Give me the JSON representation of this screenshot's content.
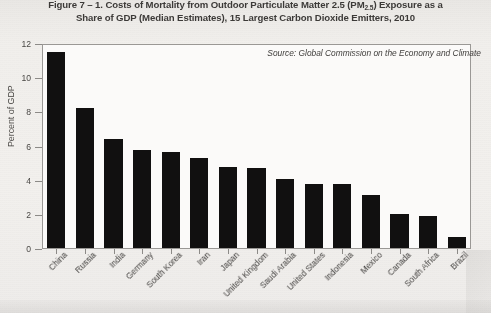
{
  "figure": {
    "title_line_1_pre": "Figure 7 – 1. Costs of Mortality from Outdoor Particulate Matter 2.5 (PM",
    "title_line_1_sub": "2.5",
    "title_line_1_post": ") Exposure as a",
    "title_line_2": "Share of GDP (Median Estimates), 15 Largest Carbon Dioxide Emitters, 2010",
    "source_note": "Source: Global Commission on the Economy and Climate"
  },
  "chart_data": {
    "type": "bar",
    "title": "Figure 7 – 1. Costs of Mortality from Outdoor Particulate Matter 2.5 (PM2.5) Exposure as a Share of GDP (Median Estimates), 15 Largest Carbon Dioxide Emitters, 2010",
    "xlabel": "",
    "ylabel": "Percent of GDP",
    "ylim": [
      0,
      12
    ],
    "yticks": [
      0,
      2,
      4,
      6,
      8,
      10,
      12
    ],
    "ytick_labels": [
      "0",
      "2",
      "4",
      "6",
      "8",
      "10",
      "12"
    ],
    "grid": false,
    "legend": null,
    "bar_color": "#111010",
    "plot_background": "#fbfaf9",
    "annotation": "Source: Global Commission on the Economy and Climate",
    "categories": [
      "China",
      "Russia",
      "India",
      "Germany",
      "South Korea",
      "Iran",
      "Japan",
      "United Kingdom",
      "Saudi Arabia",
      "United States",
      "Indonesia",
      "Mexico",
      "Canada",
      "South Africa",
      "Brazil"
    ],
    "values": [
      11.6,
      8.25,
      6.45,
      5.8,
      5.65,
      5.3,
      4.8,
      4.75,
      4.1,
      3.8,
      3.8,
      3.15,
      2.0,
      1.9,
      0.65
    ],
    "values_note": "Percent of GDP"
  }
}
